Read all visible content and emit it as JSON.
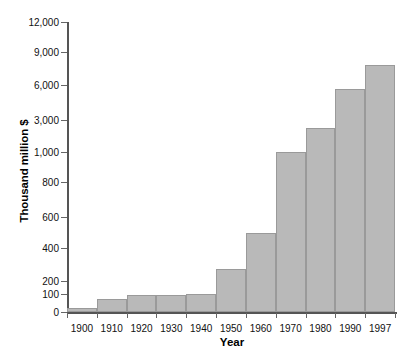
{
  "chart_data": {
    "type": "bar",
    "title": "",
    "xlabel": "Year",
    "ylabel": "Thousand million $",
    "categories": [
      "1900",
      "1910",
      "1920",
      "1930",
      "1940",
      "1950",
      "1960",
      "1970",
      "1980",
      "1990",
      "1997"
    ],
    "values": [
      20,
      70,
      95,
      95,
      100,
      270,
      500,
      1000,
      2500,
      5700,
      7800
    ],
    "y_tick_labels": [
      "0",
      "100",
      "200",
      "400",
      "600",
      "800",
      "1,000",
      "3,000",
      "6,000",
      "9,000",
      "12,000"
    ],
    "y_tick_values": [
      0,
      100,
      200,
      400,
      600,
      800,
      1000,
      3000,
      6000,
      9000,
      12000
    ],
    "y_axis_scale": "non-linear-compressed",
    "ylim": [
      0,
      12000
    ],
    "grid": false,
    "legend": false,
    "bar_color": "#b9b9b9",
    "bar_border_color": "#9a9a9a",
    "axis_color": "#555555",
    "text_color": "#111111"
  },
  "axis": {
    "y_title": "Thousand million $",
    "x_title": "Year"
  }
}
